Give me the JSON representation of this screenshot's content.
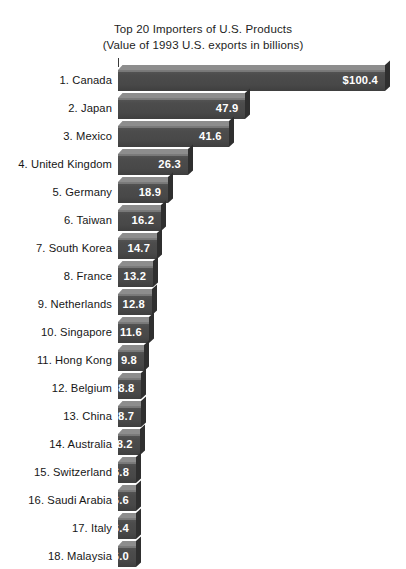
{
  "title": {
    "line1": "Top 20 Importers of U.S. Products",
    "line2": "(Value of 1993 U.S. exports in billions)"
  },
  "chart_data": {
    "type": "bar",
    "orientation": "horizontal",
    "title": "Top 20 Importers of U.S. Products",
    "subtitle": "(Value of 1993 U.S. exports in billions)",
    "xlabel": "",
    "ylabel": "",
    "grid": false,
    "legend": null,
    "xlim": [
      0,
      100.4
    ],
    "value_unit": "billions of U.S. dollars",
    "note": "Chart is cropped at the bottom; ranks 19 and 20 are not fully visible (a 19th bar is partially cut off at the bottom edge).",
    "categories": [
      "1. Canada",
      "2. Japan",
      "3. Mexico",
      "4. United Kingdom",
      "5. Germany",
      "6. Taiwan",
      "7. South Korea",
      "8. France",
      "9. Netherlands",
      "10. Singapore",
      "11. Hong Kong",
      "12. Belgium",
      "13. China",
      "14. Australia",
      "15. Switzerland",
      "16. Saudi Arabia",
      "17. Italy",
      "18. Malaysia"
    ],
    "values": [
      100.4,
      47.9,
      41.6,
      26.3,
      18.9,
      16.2,
      14.7,
      13.2,
      12.8,
      11.6,
      9.8,
      8.8,
      8.7,
      8.2,
      6.8,
      6.6,
      6.4,
      6.0
    ],
    "value_labels": [
      "$100.4",
      "47.9",
      "41.6",
      "26.3",
      "18.9",
      "16.2",
      "14.7",
      "13.2",
      "12.8",
      "11.6",
      "9.8",
      "8.8",
      "8.7",
      "8.2",
      "6.8",
      "6.6",
      "6.4",
      "6.0"
    ]
  },
  "colors": {
    "background": "#ffffff",
    "bar_front": "#4a4a4a",
    "bar_top": "#8d8d8d",
    "bar_side": "#2f2f2f",
    "text": "#161616",
    "value_text": "#ffffff"
  }
}
